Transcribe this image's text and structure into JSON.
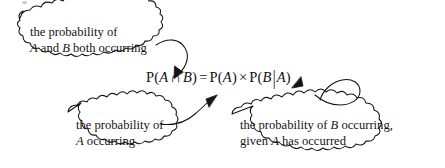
{
  "page": {
    "kind": "annotated-math-diagram",
    "background_color": "#ffffff",
    "ink_color": "#141414",
    "width": 445,
    "height": 168
  },
  "formula": {
    "full_text": "P(A ∩ B) = P(A) × P(B|A)",
    "p_open_1": "P(",
    "var_a_1": "A",
    "intersection_symbol": "∩",
    "var_b_1": "B",
    "close_1": ")",
    "equals": "=",
    "p_open_2": "P(",
    "var_a_2": "A",
    "close_2": ")",
    "times_symbol": "×",
    "p_open_3": "P(",
    "var_b_2": "B",
    "given_bar": "|",
    "var_a_3": "A",
    "close_3": ")"
  },
  "callouts": [
    {
      "id": "intersection",
      "line1": "the probability of",
      "line2_before": "",
      "line2_var_a": "A",
      "line2_middle": " and ",
      "line2_var_b": "B",
      "line2_after": " both occurring",
      "points_to": "P(A ∩ B)"
    },
    {
      "id": "prob-a",
      "line1": "the probability of",
      "line2_var_a": "A",
      "line2_after": " occurring",
      "points_to": "P(A)"
    },
    {
      "id": "cond-b",
      "line1_before": "the probability of ",
      "line1_var_b": "B",
      "line1_after": " occurring,",
      "line2_before": "given ",
      "line2_var_a": "A",
      "line2_after": " has occurred",
      "points_to": "P(B|A)"
    }
  ],
  "arrows": [
    {
      "id": "arrow-to-intersection",
      "from": "cloud-intersection",
      "to": "formula-left-term",
      "direction": "down-left"
    },
    {
      "id": "arrow-to-prob-a",
      "from": "cloud-prob-a",
      "to": "formula-p-a-term",
      "direction": "up-right"
    },
    {
      "id": "arrow-to-cond-b",
      "from": "cloud-cond-b",
      "to": "formula-conditional-term",
      "direction": "up-left"
    }
  ]
}
